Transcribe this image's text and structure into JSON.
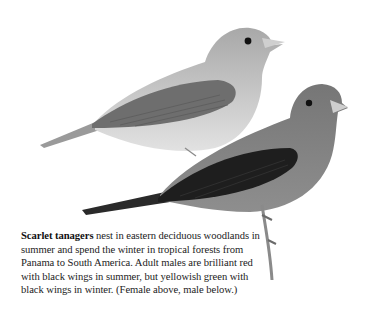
{
  "illustration": {
    "subject": "Scarlet tanagers",
    "birds": [
      {
        "label": "female",
        "position": "above"
      },
      {
        "label": "male",
        "position": "below"
      }
    ],
    "colors": {
      "female_body": "#b9b9b9",
      "female_belly": "#dcdcdc",
      "female_wing": "#6a6a6a",
      "male_body": "#7d7d7d",
      "male_wing": "#1e1e1e",
      "beak": "#cfcfcf",
      "eye": "#111111",
      "branch": "#8a8a8a"
    }
  },
  "caption": {
    "bold_lead": "Scarlet tanagers",
    "text": " nest in eastern deciduous woodlands in summer and spend the winter in tropical forests from Panama to South America. Adult males are brilliant red with black wings in summer, but yellowish green with black wings in winter. (Female above, male below.)"
  }
}
